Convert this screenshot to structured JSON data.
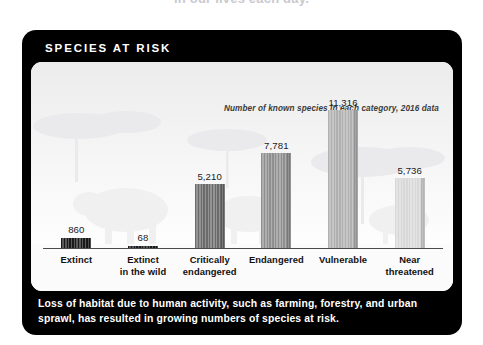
{
  "page": {
    "clipped_top_text": "in our lives each day."
  },
  "card": {
    "header_label": "SPECIES AT RISK",
    "caption": "Loss of habitat due to human activity, such as farming, forestry, and urban sprawl, has resulted in growing numbers of species at risk.",
    "colors": {
      "card_background": "#000000",
      "panel_background": "#fdfdfd",
      "header_text": "#ffffff",
      "caption_text": "#ffffff"
    }
  },
  "chart_data": {
    "type": "bar",
    "title": "SPECIES AT RISK",
    "subtitle": "Number of known species in each category, 2016 data",
    "xlabel": "",
    "ylabel": "",
    "ylim": [
      0,
      11316
    ],
    "grid": false,
    "legend": "none",
    "categories": [
      "Extinct",
      "Extinct in the wild",
      "Critically endangered",
      "Endangered",
      "Vulnerable",
      "Near threatened"
    ],
    "category_lines": [
      [
        "Extinct"
      ],
      [
        "Extinct",
        "in the wild"
      ],
      [
        "Critically",
        "endangered"
      ],
      [
        "Endangered"
      ],
      [
        "Vulnerable"
      ],
      [
        "Near",
        "threatened"
      ]
    ],
    "values": [
      860,
      68,
      5210,
      7781,
      11316,
      5736
    ],
    "value_labels": [
      "860",
      "68",
      "5,210",
      "7,781",
      "11,316",
      "5,736"
    ],
    "bar_colors": [
      "#1a1a1a",
      "#1a1a1a",
      "#6b6b6b",
      "#8f8f8f",
      "#b0b0b0",
      "#d8d8d8"
    ]
  }
}
